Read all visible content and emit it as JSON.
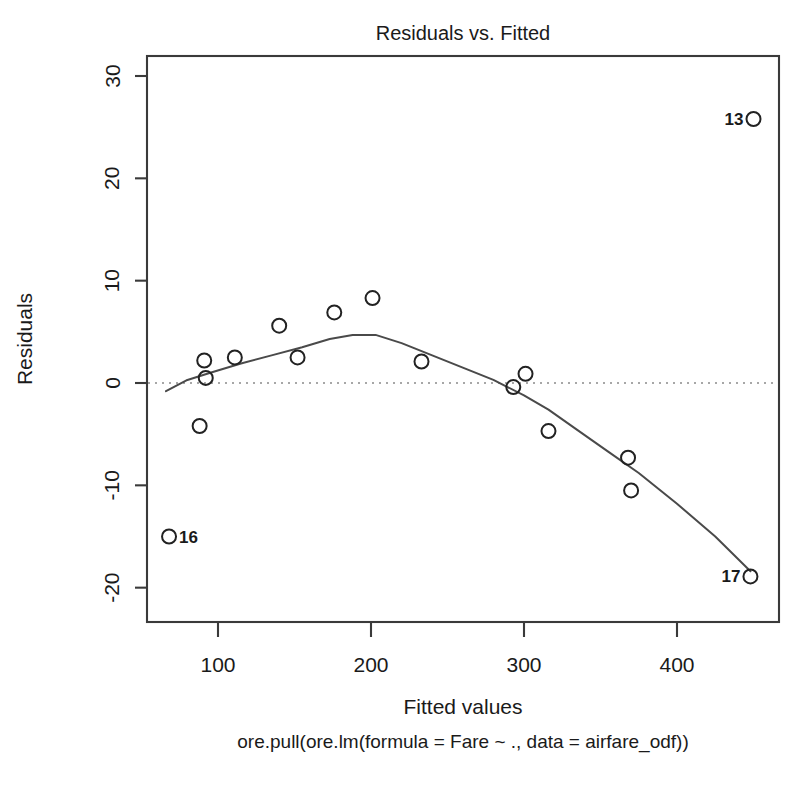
{
  "chart_data": {
    "type": "scatter",
    "title": "Residuals vs. Fitted",
    "xlabel": "Fitted values",
    "ylabel": "Residuals",
    "subtitle": "ore.pull(ore.lm(formula = Fare ~ ., data = airfare_odf))",
    "xlim": [
      62,
      475
    ],
    "ylim": [
      -23.5,
      32
    ],
    "xticks": [
      100,
      200,
      300,
      400
    ],
    "yticks": [
      -20,
      -10,
      0,
      10,
      20,
      30
    ],
    "grid": false,
    "legend": "none",
    "zero_reference_line": 0,
    "points": [
      {
        "x": 68,
        "y": -15.0,
        "label": "16",
        "label_side": "right"
      },
      {
        "x": 88,
        "y": -4.2,
        "label": null,
        "label_side": null
      },
      {
        "x": 91,
        "y": 2.2,
        "label": null,
        "label_side": null
      },
      {
        "x": 92,
        "y": 0.5,
        "label": null,
        "label_side": null
      },
      {
        "x": 111,
        "y": 2.5,
        "label": null,
        "label_side": null
      },
      {
        "x": 140,
        "y": 5.6,
        "label": null,
        "label_side": null
      },
      {
        "x": 152,
        "y": 2.5,
        "label": null,
        "label_side": null
      },
      {
        "x": 176,
        "y": 6.9,
        "label": null,
        "label_side": null
      },
      {
        "x": 201,
        "y": 8.3,
        "label": null,
        "label_side": null
      },
      {
        "x": 233,
        "y": 2.1,
        "label": null,
        "label_side": null
      },
      {
        "x": 293,
        "y": -0.4,
        "label": null,
        "label_side": null
      },
      {
        "x": 301,
        "y": 0.9,
        "label": null,
        "label_side": null
      },
      {
        "x": 316,
        "y": -4.7,
        "label": null,
        "label_side": null
      },
      {
        "x": 368,
        "y": -7.3,
        "label": null,
        "label_side": null
      },
      {
        "x": 370,
        "y": -10.5,
        "label": null,
        "label_side": null
      },
      {
        "x": 450,
        "y": 25.8,
        "label": "13",
        "label_side": "left"
      },
      {
        "x": 448,
        "y": -18.9,
        "label": "17",
        "label_side": "left"
      }
    ],
    "smoother": [
      {
        "x": 66,
        "y": -0.8
      },
      {
        "x": 80,
        "y": 0.3
      },
      {
        "x": 95,
        "y": 1.0
      },
      {
        "x": 115,
        "y": 1.9
      },
      {
        "x": 135,
        "y": 2.7
      },
      {
        "x": 155,
        "y": 3.5
      },
      {
        "x": 173,
        "y": 4.3
      },
      {
        "x": 188,
        "y": 4.7
      },
      {
        "x": 203,
        "y": 4.7
      },
      {
        "x": 220,
        "y": 3.9
      },
      {
        "x": 240,
        "y": 2.7
      },
      {
        "x": 260,
        "y": 1.5
      },
      {
        "x": 280,
        "y": 0.3
      },
      {
        "x": 300,
        "y": -1.2
      },
      {
        "x": 316,
        "y": -2.6
      },
      {
        "x": 335,
        "y": -4.6
      },
      {
        "x": 355,
        "y": -6.7
      },
      {
        "x": 375,
        "y": -8.8
      },
      {
        "x": 400,
        "y": -11.8
      },
      {
        "x": 425,
        "y": -15.0
      },
      {
        "x": 448,
        "y": -18.4
      }
    ]
  }
}
